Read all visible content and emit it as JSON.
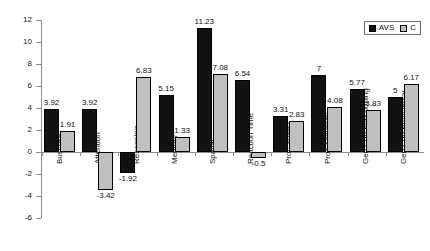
{
  "chart_data": {
    "type": "bar",
    "title": "",
    "subtitle": "",
    "xlabel": "",
    "ylabel": "",
    "ylim": [
      -6,
      12
    ],
    "yticks": [
      12,
      10,
      8,
      6,
      4,
      2,
      0,
      -2,
      -4,
      -6
    ],
    "ytick_labels": [
      "12",
      "10",
      "8",
      "6",
      "4",
      "2",
      "0",
      "-2",
      "-4",
      "-6"
    ],
    "grid": false,
    "legend_position": "top-right",
    "categories": [
      "Buschke",
      "Attention",
      "Reasoning",
      "Memory",
      "Spatial",
      "Reaction Time",
      "Proc Speed",
      "Proc Accuracy",
      "Gen Cog Functioning",
      "Gen Cog Proficiency"
    ],
    "series": [
      {
        "name": "AVS",
        "color": "#111111",
        "values": [
          3.92,
          3.92,
          -1.92,
          5.15,
          11.23,
          6.54,
          3.31,
          7,
          5.77,
          5
        ],
        "labels": [
          "3.92",
          "3.92",
          "-1.92",
          "5.15",
          "11.23",
          "6.54",
          "3.31",
          "7",
          "5.77",
          "5"
        ]
      },
      {
        "name": "C",
        "color": "#bfbfbf",
        "values": [
          1.91,
          -3.42,
          6.83,
          1.33,
          7.08,
          -0.5,
          2.83,
          4.08,
          3.83,
          6.17
        ],
        "labels": [
          "1.91",
          "-3.42",
          "6.83",
          "1.33",
          "7.08",
          "-0.5",
          "2.83",
          "4.08",
          "3.83",
          "6.17"
        ]
      }
    ]
  },
  "legend": {
    "entries": [
      {
        "label": "AVS"
      },
      {
        "label": "C"
      }
    ]
  }
}
